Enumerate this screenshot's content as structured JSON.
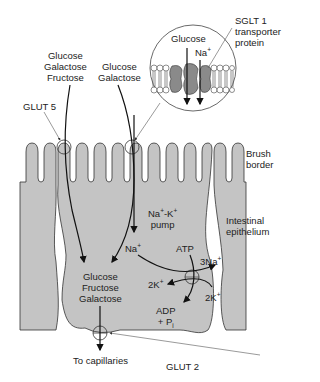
{
  "diagram": {
    "colors": {
      "cell_fill": "#c4c4c4",
      "outline": "#333333",
      "protein_fill": "#8a8a8a",
      "background": "#ffffff"
    },
    "labels": {
      "lumen_left": [
        "Glucose",
        "Galactose",
        "Fructose"
      ],
      "lumen_right": [
        "Glucose",
        "Galactose"
      ],
      "glut5": "GLUT 5",
      "sglt1": [
        "SGLT 1",
        "transporter",
        "protein"
      ],
      "inset_glucose": "Glucose",
      "inset_na": "Na",
      "inset_na_sup": "+",
      "brush_border": [
        "Brush",
        "border"
      ],
      "pump": [
        "Na+-K+",
        "pump"
      ],
      "pump_na": "Na",
      "pump_k": "-K",
      "pump_word": "pump",
      "intestinal_epithelium": [
        "Intestinal",
        "epithelium"
      ],
      "cell_na": "Na",
      "atp": "ATP",
      "three_na": "3Na",
      "two_k_left": "2K",
      "two_k_right": "2K",
      "adp": "ADP",
      "pi": "+ P",
      "pi_sub": "i",
      "cell_sugars": [
        "Glucose",
        "Fructose",
        "Galactose"
      ],
      "to_capillaries": "To capillaries",
      "glut2": "GLUT 2",
      "plus": "+"
    }
  }
}
